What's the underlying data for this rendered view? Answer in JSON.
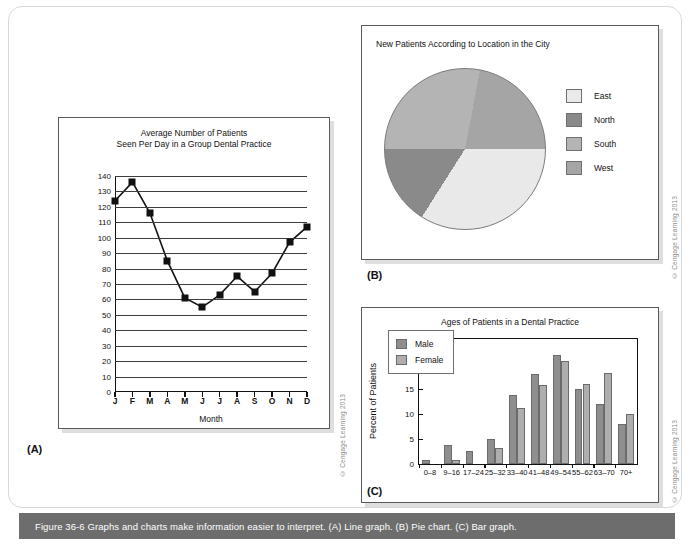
{
  "page": {
    "caption": "Figure 36-6  Graphs and charts make information easier to interpret. (A) Line graph. (B) Pie chart. (C) Bar graph.",
    "credit": "© Cengage Learning 2013",
    "label_a": "(A)",
    "label_b": "(B)",
    "label_c": "(C)"
  },
  "colors": {
    "east": "#e9e9e9",
    "north": "#8a8a8a",
    "south": "#b4b4b4",
    "west": "#a5a5a5",
    "male": "#8e8e8e",
    "female": "#aeaeae",
    "caption_bar": "#6d6d6d",
    "marker": "#111111"
  },
  "chart_data": [
    {
      "type": "line",
      "panel": "A",
      "title": "Average Number of Patients\nSeen Per Day in a Group Dental Practice",
      "title_line1": "Average Number of Patients",
      "title_line2": "Seen Per Day in a Group Dental Practice",
      "xlabel": "Month",
      "ylabel": "",
      "categories": [
        "J",
        "F",
        "M",
        "A",
        "M",
        "J",
        "J",
        "A",
        "S",
        "O",
        "N",
        "D"
      ],
      "values": [
        124,
        136,
        116,
        85,
        61,
        55,
        63,
        75,
        65,
        77,
        97,
        107
      ],
      "ylim": [
        0,
        140
      ],
      "yticks": [
        0,
        10,
        20,
        30,
        40,
        50,
        60,
        70,
        80,
        90,
        100,
        110,
        120,
        130,
        140
      ],
      "grid": true,
      "legend": "none"
    },
    {
      "type": "pie",
      "panel": "B",
      "title": "New Patients According to Location in the City",
      "labels": [
        "East",
        "North",
        "South",
        "West"
      ],
      "values": [
        34,
        16,
        28,
        22
      ],
      "legend_position": "right",
      "start_angle_deg": 90
    },
    {
      "type": "bar",
      "panel": "C",
      "title": "Ages of Patients in a Dental Practice",
      "xlabel": "",
      "ylabel": "Percent of Patients",
      "categories": [
        "0–8",
        "9–16",
        "17–24",
        "25–32",
        "33–40",
        "41–48",
        "49–54",
        "55–62",
        "63–70",
        "70+"
      ],
      "series": [
        {
          "name": "Male",
          "values": [
            0.8,
            3.8,
            2.6,
            5.1,
            13.9,
            18.0,
            21.9,
            15.1,
            12.1,
            8.0
          ]
        },
        {
          "name": "Female",
          "values": [
            0.0,
            0.9,
            0.0,
            3.2,
            11.3,
            15.8,
            20.6,
            16.0,
            18.2,
            10.0
          ]
        }
      ],
      "ylim": [
        0,
        25
      ],
      "yticks": [
        0,
        5,
        10,
        15,
        20,
        25
      ],
      "grid": false,
      "legend_position": "inside-top-left"
    }
  ]
}
